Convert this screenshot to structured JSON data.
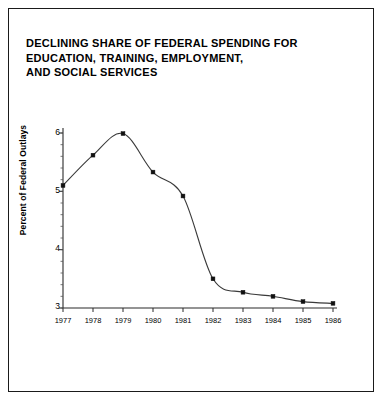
{
  "figure": {
    "background": "#ffffff",
    "border_color": "#1a1a1a"
  },
  "title": {
    "line1": "DECLINING SHARE OF FEDERAL SPENDING FOR",
    "line2": "EDUCATION, TRAINING, EMPLOYMENT,",
    "line3": "AND SOCIAL SERVICES"
  },
  "axes": {
    "ylabel": "Percent of Federal Outlays",
    "ytick_labels": [
      "6",
      "5",
      "4",
      "3"
    ],
    "xtick_labels": [
      "1977",
      "1978",
      "1979",
      "1980",
      "1981",
      "1982",
      "1983",
      "1984",
      "1985",
      "1986"
    ]
  },
  "chart_data": {
    "type": "line",
    "title": "DECLINING SHARE OF FEDERAL SPENDING FOR EDUCATION, TRAINING, EMPLOYMENT, AND SOCIAL SERVICES",
    "xlabel": "",
    "ylabel": "Percent of Federal Outlays",
    "x": [
      1977,
      1978,
      1979,
      1980,
      1981,
      1982,
      1983,
      1984,
      1985,
      1986
    ],
    "categories": [
      "1977",
      "1978",
      "1979",
      "1980",
      "1981",
      "1982",
      "1983",
      "1984",
      "1985",
      "1986"
    ],
    "values": [
      5.1,
      5.62,
      5.99,
      5.33,
      4.92,
      3.5,
      3.27,
      3.2,
      3.11,
      3.08
    ],
    "series": [
      {
        "name": "Percent of Federal Outlays",
        "values": [
          5.1,
          5.62,
          5.99,
          5.33,
          4.92,
          3.5,
          3.27,
          3.2,
          3.11,
          3.08
        ]
      }
    ],
    "ylim": [
      3,
      6.15
    ],
    "xlim": [
      1977,
      1986
    ],
    "yticks": [
      3,
      4,
      5,
      6
    ],
    "xticks": [
      1977,
      1978,
      1979,
      1980,
      1981,
      1982,
      1983,
      1984,
      1985,
      1986
    ],
    "grid": false,
    "legend": false,
    "marker": "square",
    "line_color": "#3a3a3a",
    "marker_color": "#111111",
    "smoothing": "spline"
  }
}
